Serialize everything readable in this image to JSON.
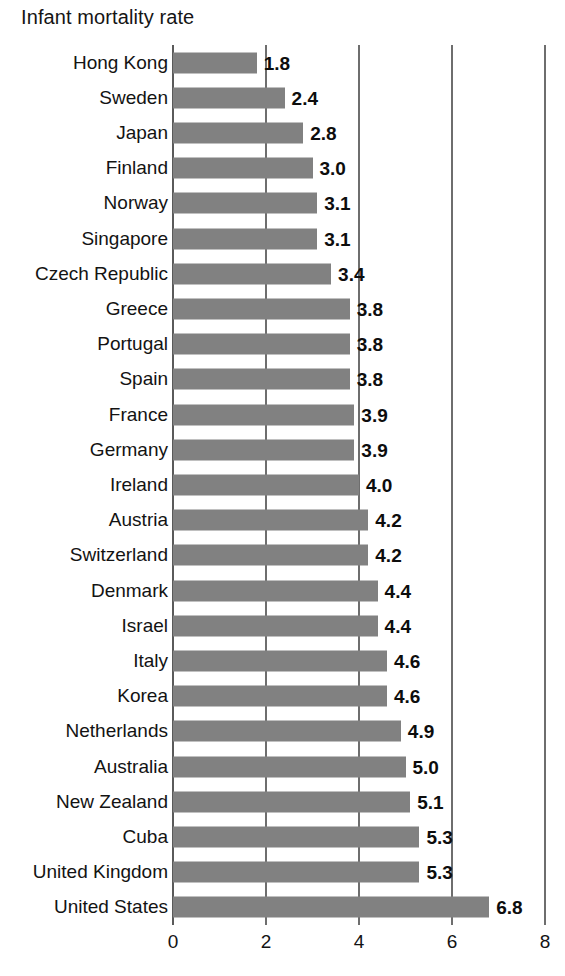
{
  "chart_data": {
    "type": "bar",
    "orientation": "horizontal",
    "title": "Infant mortality rate",
    "xlabel": "",
    "ylabel": "",
    "xlim": [
      0,
      8
    ],
    "xticks": [
      "0",
      "2",
      "4",
      "6",
      "8"
    ],
    "xtick_values": [
      0,
      2,
      4,
      6,
      8
    ],
    "grid": true,
    "grid_axis": "x",
    "legend": false,
    "bar_color": "#818181",
    "gridline_color": "#6e6e6e",
    "text_color": "#131313",
    "categories": [
      "Hong Kong",
      "Sweden",
      "Japan",
      "Finland",
      "Norway",
      "Singapore",
      "Czech Republic",
      "Greece",
      "Portugal",
      "Spain",
      "France",
      "Germany",
      "Ireland",
      "Austria",
      "Switzerland",
      "Denmark",
      "Israel",
      "Italy",
      "Korea",
      "Netherlands",
      "Australia",
      "New Zealand",
      "Cuba",
      "United Kingdom",
      "United States"
    ],
    "values": [
      1.8,
      2.4,
      2.8,
      3.0,
      3.1,
      3.1,
      3.4,
      3.8,
      3.8,
      3.8,
      3.9,
      3.9,
      4.0,
      4.2,
      4.2,
      4.4,
      4.4,
      4.6,
      4.6,
      4.9,
      5.0,
      5.1,
      5.3,
      5.3,
      6.8
    ],
    "value_labels": [
      "1.8",
      "2.4",
      "2.8",
      "3.0",
      "3.1",
      "3.1",
      "3.4",
      "3.8",
      "3.8",
      "3.8",
      "3.9",
      "3.9",
      "4.0",
      "4.2",
      "4.2",
      "4.4",
      "4.4",
      "4.6",
      "4.6",
      "4.9",
      "5.0",
      "5.1",
      "5.3",
      "5.3",
      "6.8"
    ]
  }
}
